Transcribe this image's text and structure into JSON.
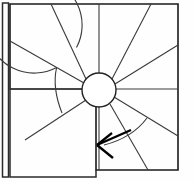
{
  "drawing": {
    "title": "Winder staircase plan",
    "type": "architectural-line-drawing",
    "canvas": {
      "width": 194,
      "height": 182
    },
    "colors": {
      "background": "#fefefe",
      "line": "#2b2b2b",
      "line_light": "#3a3a3a",
      "arrow": "#000000",
      "newel_fill": "#ffffff"
    },
    "left_stringer": {
      "name": "left-edge-stringer",
      "x": 2.5,
      "y_top": 3,
      "y_bottom": 177,
      "width": 6
    },
    "outer_frame": {
      "name": "stair-enclosure-outline",
      "points": "10,4 178,4 178,170 96,170 96,89 10,89"
    },
    "inner_step_line": {
      "name": "landing-step-line",
      "points": "10,89 96,89 96,170"
    },
    "newel": {
      "name": "central-newel-post",
      "cx": 99,
      "cy": 90,
      "r": 17
    },
    "outer_arc": {
      "name": "winder-outer-arc",
      "cx": 99,
      "cy": 90,
      "r": 48,
      "gap_start_deg": 118,
      "gap_end_deg": 152
    },
    "treads": [
      {
        "name": "tread-riser-1",
        "angle_deg": 200,
        "label": "1"
      },
      {
        "name": "tread-riser-2",
        "angle_deg": 168,
        "label": "2"
      },
      {
        "name": "tread-riser-3",
        "angle_deg": 143,
        "label": "3"
      },
      {
        "name": "tread-riser-4",
        "angle_deg": 118,
        "label": "4"
      },
      {
        "name": "tread-riser-5",
        "angle_deg": 95,
        "label": "5"
      },
      {
        "name": "tread-riser-6",
        "angle_deg": 68,
        "label": "6"
      },
      {
        "name": "tread-riser-7",
        "angle_deg": 40,
        "label": "7"
      },
      {
        "name": "tread-riser-8",
        "angle_deg": 10,
        "label": "8"
      },
      {
        "name": "tread-riser-9",
        "angle_deg": 340,
        "label": "9"
      },
      {
        "name": "tread-riser-10",
        "angle_deg": 310,
        "label": "10"
      },
      {
        "name": "tread-riser-11",
        "angle_deg": 285,
        "label": "11"
      },
      {
        "name": "tread-riser-12",
        "angle_deg": 258,
        "label": "12"
      }
    ],
    "direction_arrow": {
      "name": "travel-direction-arrow",
      "shaft_start_x": 131,
      "shaft_start_y": 130,
      "shaft_end_x": 97,
      "shaft_end_y": 145,
      "head_a_x": 112,
      "head_a_y": 133,
      "head_b_x": 113,
      "head_b_y": 158,
      "points_toward": "left"
    },
    "arrow_guide_curve": {
      "name": "travel-path-curve",
      "path": "M 147,118 Q 132,138 104,145"
    }
  }
}
